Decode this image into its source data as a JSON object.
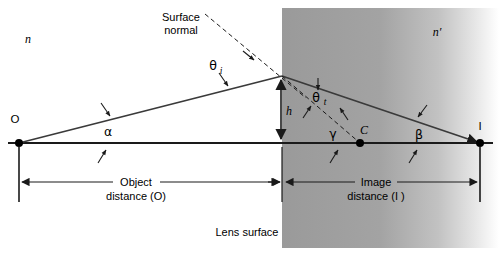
{
  "figure": {
    "background_color": "#ffffff",
    "medium_fill_color": "#9a9a9a",
    "line_color": "#1a1a1a"
  },
  "labels": {
    "n_left": "n",
    "n_right": "n′",
    "surface_normal_line1": "Surface",
    "surface_normal_line2": "normal",
    "theta_i_base": "θ",
    "theta_i_sub": "i",
    "theta_t_base": "θ",
    "theta_t_sub": "t",
    "alpha": "α",
    "beta": "β",
    "gamma": "γ",
    "height_h": "h",
    "point_o": "O",
    "point_i": "I",
    "point_c": "C",
    "object_distance_line1": "Object",
    "object_distance_line2": "distance (O)",
    "image_distance_line1": "Image",
    "image_distance_line2": "distance (I )",
    "lens_surface": "Lens surface"
  },
  "geometry": {
    "point_o_x": 19,
    "point_o_y": 143,
    "point_i_x": 480,
    "point_i_y": 143,
    "point_c_x": 360,
    "point_c_y": 143,
    "vertex_x": 282,
    "vertex_y": 76,
    "axis_y": 143,
    "medium_left_x": 282,
    "medium_top_y": 8,
    "medium_bottom_y": 248,
    "medium_right_x": 499,
    "object_distance_arrow_y": 182,
    "image_distance_arrow_y": 182
  }
}
